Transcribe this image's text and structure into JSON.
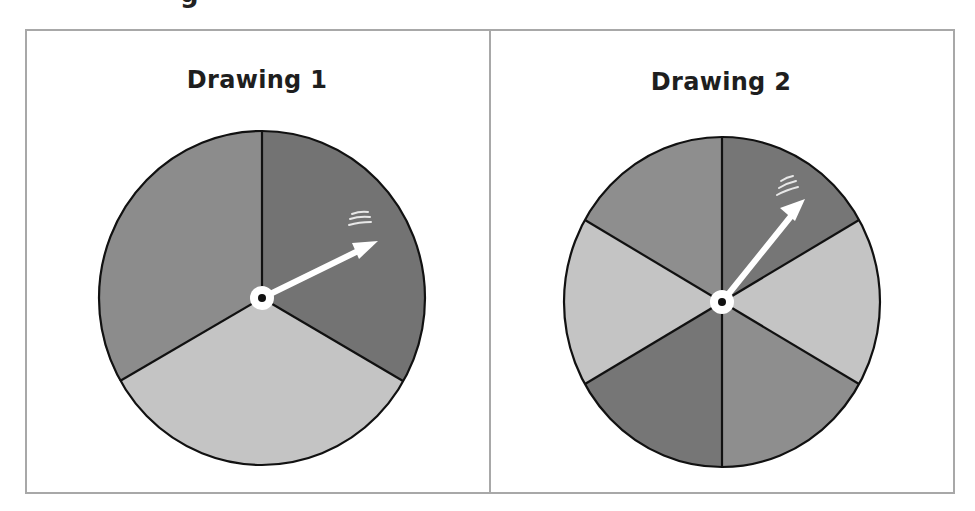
{
  "heading_cut": "g",
  "panels": [
    {
      "title": "Drawing 1",
      "spinner": {
        "sections": 3,
        "center": [
          262,
          298
        ],
        "radius": [
          163,
          167
        ],
        "sector_colors_clockwise_from_top": [
          "#737373",
          "#c4c4c4",
          "#8c8c8c"
        ],
        "sector_shades_clockwise_from_top": [
          "dark gray",
          "light gray",
          "medium gray"
        ],
        "arrow_tip": [
          378,
          241
        ]
      }
    },
    {
      "title": "Drawing 2",
      "spinner": {
        "sections": 6,
        "center": [
          722,
          302
        ],
        "radius": [
          158,
          165
        ],
        "sector_colors_clockwise_from_top": [
          "#767676",
          "#c4c4c4",
          "#8e8e8e",
          "#767676",
          "#c4c4c4",
          "#8e8e8e"
        ],
        "sector_shades_clockwise_from_top": [
          "dark gray",
          "light gray",
          "medium gray",
          "dark gray",
          "light gray",
          "medium gray"
        ],
        "arrow_tip": [
          805,
          199
        ]
      }
    }
  ],
  "colors": {
    "frame_border": "#a8a8a8",
    "outline": "#111111",
    "arrow": "#ffffff"
  }
}
